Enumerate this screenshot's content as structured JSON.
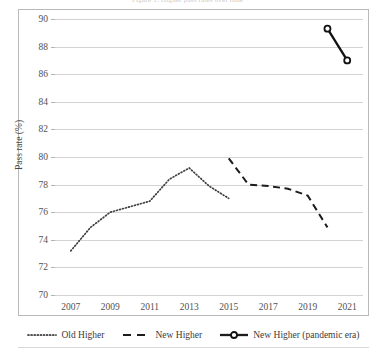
{
  "chart_data": {
    "type": "line",
    "title": "Figure 1: Higher pass rates over time",
    "xlabel": "",
    "ylabel": "Pass rate (%)",
    "xlim": [
      2006.2,
      2021.8
    ],
    "ylim": [
      70,
      90
    ],
    "yticks": [
      70,
      72,
      74,
      76,
      78,
      80,
      82,
      84,
      86,
      88,
      90
    ],
    "xticks": [
      2007,
      2009,
      2011,
      2013,
      2015,
      2017,
      2019,
      2021
    ],
    "grid": "horizontal",
    "legend_position": "bottom",
    "series": [
      {
        "name": "Old Higher",
        "style": "dotted",
        "color": "#404040",
        "marker": "none",
        "x": [
          2007,
          2008,
          2009,
          2010,
          2011,
          2012,
          2013,
          2014,
          2015
        ],
        "values": [
          73.2,
          74.9,
          76.0,
          76.4,
          76.8,
          78.4,
          79.2,
          77.9,
          77.0
        ]
      },
      {
        "name": "New Higher",
        "style": "dashed",
        "color": "#1c1c1c",
        "marker": "none",
        "x": [
          2015,
          2016,
          2017,
          2018,
          2019,
          2020
        ],
        "values": [
          79.9,
          78.0,
          77.9,
          77.7,
          77.2,
          74.9
        ]
      },
      {
        "name": "New Higher (pandemic era)",
        "style": "solid",
        "color": "#111111",
        "marker": "open-circle",
        "x": [
          2020,
          2021
        ],
        "values": [
          89.3,
          87.0
        ]
      }
    ]
  },
  "axes": {
    "y_label": "Pass rate (%)",
    "y_tick_labels": [
      "90",
      "88",
      "86",
      "84",
      "82",
      "80",
      "78",
      "76",
      "74",
      "72",
      "70"
    ],
    "x_tick_labels": [
      "2007",
      "2009",
      "2011",
      "2013",
      "2015",
      "2017",
      "2019",
      "2021"
    ]
  },
  "legend": {
    "items": [
      {
        "label": "Old Higher",
        "swatch": "dotted-line-swatch"
      },
      {
        "label": "New Higher",
        "swatch": "dashed-line-swatch"
      },
      {
        "label": "New Higher (pandemic era)",
        "swatch": "solid-line-marker-swatch"
      }
    ]
  },
  "colors": {
    "gridline": "#d3d3d3",
    "frame": "#b9b9b9",
    "series_ink": "#1c1c1c",
    "text": "#3d3a39"
  }
}
